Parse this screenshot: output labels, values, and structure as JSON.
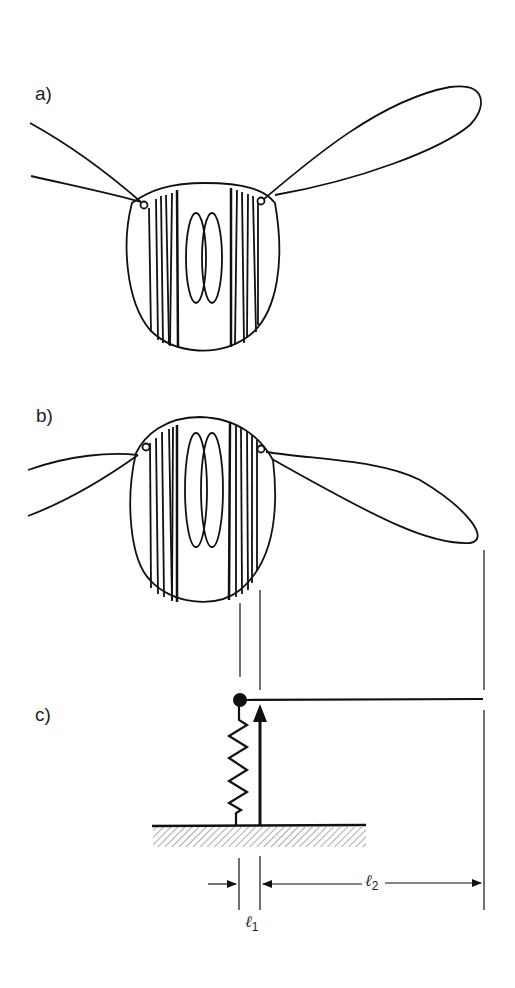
{
  "figure": {
    "panels": [
      {
        "id": "a",
        "label": "a)",
        "description": "Insect thorax front view, wings raised (upstroke position)"
      },
      {
        "id": "b",
        "label": "b)",
        "description": "Insect thorax front view, wings lowered (downstroke position)"
      },
      {
        "id": "c",
        "label": "c)",
        "description": "Mechanical lever model: spring and force arrow acting on a pivoted beam"
      }
    ],
    "dimensions": {
      "l1": {
        "symbol": "ℓ",
        "subscript": "1"
      },
      "l2": {
        "symbol": "ℓ",
        "subscript": "2"
      }
    },
    "colors": {
      "ink": "#111111",
      "background": "#ffffff"
    }
  }
}
